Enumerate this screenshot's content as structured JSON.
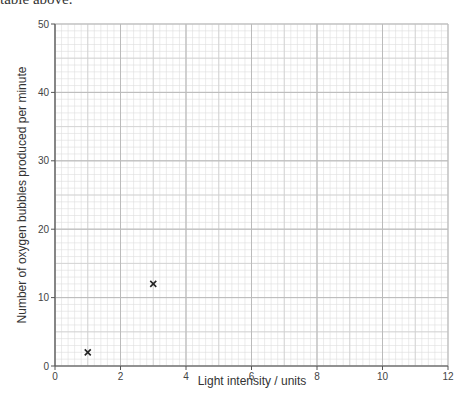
{
  "page": {
    "top_text": "table above."
  },
  "chart_data": {
    "type": "scatter",
    "title": "",
    "xlabel": "Light intensity / units",
    "ylabel": "Number of oxygen bubbles produced per minute",
    "xlim": [
      0,
      12
    ],
    "ylim": [
      0,
      50
    ],
    "x_ticks": [
      0,
      2,
      4,
      6,
      8,
      10,
      12
    ],
    "y_ticks": [
      0,
      10,
      20,
      30,
      40,
      50
    ],
    "x_tick_labels": [
      "0",
      "2",
      "4",
      "6",
      "8",
      "10",
      "12"
    ],
    "y_tick_labels": [
      "0",
      "10",
      "20",
      "30",
      "40",
      "50"
    ],
    "grid": true,
    "grid_minor_x_step": 0.2,
    "grid_minor_y_step": 1,
    "grid_major_x_step": 2,
    "grid_major_y_step": 10,
    "marker": "x",
    "points": [
      {
        "x": 1,
        "y": 2
      },
      {
        "x": 3,
        "y": 12
      }
    ],
    "colors": {
      "axis": "#555555",
      "grid_minor": "#dddddd",
      "grid_major": "#bbbbbb",
      "marker": "#222222"
    }
  }
}
